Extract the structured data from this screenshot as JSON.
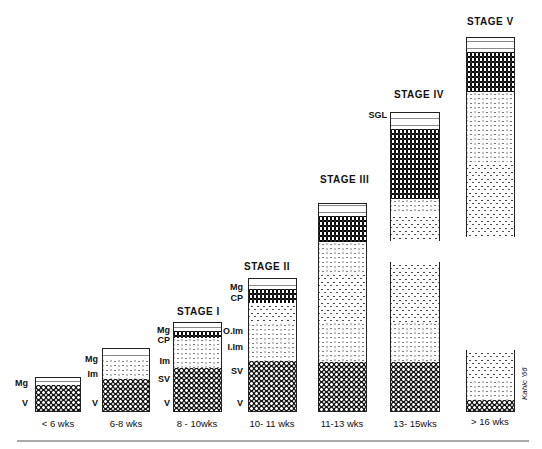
{
  "figure": {
    "stages": [
      {
        "id": "pre",
        "stage_label": "",
        "age": "< 6 wks",
        "layers": [
          "Mg",
          "V"
        ]
      },
      {
        "id": "pre2",
        "stage_label": "",
        "age": "6-8 wks",
        "layers": [
          "Mg",
          "Im",
          "V"
        ]
      },
      {
        "id": "s1",
        "stage_label": "STAGE I",
        "age": "8 - 10wks",
        "layers": [
          "Mg",
          "CP",
          "Im",
          "SV",
          "V"
        ]
      },
      {
        "id": "s2",
        "stage_label": "STAGE II",
        "age": "10- 11 wks",
        "layers": [
          "Mg",
          "CP",
          "O.Im",
          "I.Im",
          "SV",
          "V"
        ]
      },
      {
        "id": "s3",
        "stage_label": "STAGE III",
        "age": "11-13 wks",
        "layers": []
      },
      {
        "id": "s4",
        "stage_label": "STAGE IV",
        "age": "13- 15wks",
        "layers": [
          "SGL"
        ]
      },
      {
        "id": "s5",
        "stage_label": "STAGE V",
        "age": "> 16 wks",
        "layers": []
      }
    ],
    "signature": "Kahic '66"
  }
}
